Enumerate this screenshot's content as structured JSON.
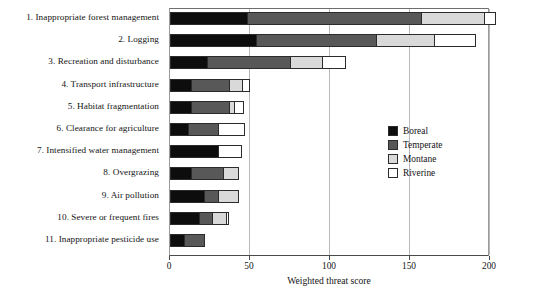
{
  "chart_data": {
    "type": "bar",
    "orientation": "horizontal",
    "stacked": true,
    "title": "",
    "xlabel": "Weighted threat score",
    "ylabel": "",
    "xlim": [
      0,
      200
    ],
    "xticks": [
      0,
      50,
      100,
      150,
      200
    ],
    "xtick_labels": [
      "0",
      "50",
      "100",
      "150",
      "200"
    ],
    "grid": "vertical",
    "legend_position": "center-right",
    "categories": [
      "1. Inappropriate forest management",
      "2. Logging",
      "3. Recreation and disturbance",
      "4. Transport infrastructure",
      "5. Habitat fragmentation",
      "6. Clearance for agriculture",
      "7. Intensified water management",
      "8. Overgrazing",
      "9. Air pollution",
      "10. Severe or frequent fires",
      "11. Inappropriate pesticide use"
    ],
    "series": [
      {
        "name": "Boreal",
        "color": "#0d0d0d",
        "values": [
          48,
          54,
          23,
          13,
          13,
          11,
          30,
          13,
          21,
          18,
          9
        ]
      },
      {
        "name": "Temperate",
        "color": "#585858",
        "values": [
          109,
          75,
          52,
          24,
          24,
          19,
          0,
          20,
          9,
          8,
          13
        ]
      },
      {
        "name": "Montane",
        "color": "#d9d9d9",
        "values": [
          39,
          36,
          20,
          8,
          3,
          0,
          0,
          10,
          13,
          9,
          0
        ]
      },
      {
        "name": "Riverine",
        "color": "#ffffff",
        "values": [
          8,
          26,
          15,
          5,
          6,
          17,
          15,
          0,
          0,
          2,
          0
        ]
      }
    ],
    "totals": [
      204,
      191,
      110,
      50,
      46,
      47,
      45,
      43,
      43,
      37,
      22
    ]
  },
  "legend": {
    "items": [
      {
        "label": "Boreal",
        "color": "#0d0d0d"
      },
      {
        "label": "Temperate",
        "color": "#585858"
      },
      {
        "label": "Montane",
        "color": "#d9d9d9"
      },
      {
        "label": "Riverine",
        "color": "#ffffff"
      }
    ]
  },
  "axis": {
    "title": "Weighted threat score",
    "ticks": [
      "0",
      "50",
      "100",
      "150",
      "200"
    ]
  }
}
